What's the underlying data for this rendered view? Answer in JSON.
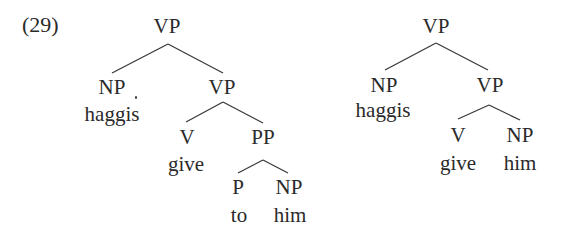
{
  "example": {
    "number": "(29)"
  },
  "colors": {
    "text": "#2a2a2a",
    "edge": "#3a3a3a",
    "background": "#ffffff"
  },
  "trees": [
    {
      "name": "left-tree",
      "root": "VP",
      "nodes": {
        "vp_root": "VP",
        "np": "NP",
        "np_word": "haggis",
        "vp_inner": "VP",
        "v": "V",
        "v_word": "give",
        "pp": "PP",
        "p": "P",
        "p_word": "to",
        "np2": "NP",
        "np2_word": "him"
      },
      "structure": "[VP [NP haggis] [VP [V give] [PP [P to] [NP him]]]]"
    },
    {
      "name": "right-tree",
      "root": "VP",
      "nodes": {
        "vp_root": "VP",
        "np": "NP",
        "np_word": "haggis",
        "vp_inner": "VP",
        "v": "V",
        "v_word": "give",
        "np2": "NP",
        "np2_word": "him"
      },
      "structure": "[VP [NP haggis] [VP [V give] [NP him]]]"
    }
  ]
}
